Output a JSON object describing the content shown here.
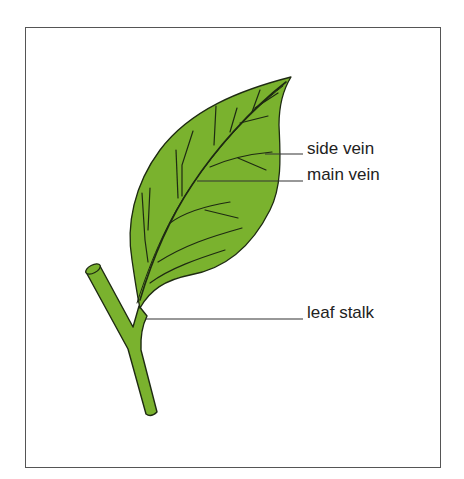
{
  "diagram": {
    "subject": "leaf",
    "colors": {
      "leaf_fill": "#7ab22e",
      "outline": "#1e2a12",
      "leader_line": "#333333",
      "frame_border": "#555555"
    },
    "labels": [
      {
        "id": "side-vein",
        "text": "side vein"
      },
      {
        "id": "main-vein",
        "text": "main vein"
      },
      {
        "id": "leaf-stalk",
        "text": "leaf stalk"
      }
    ]
  }
}
